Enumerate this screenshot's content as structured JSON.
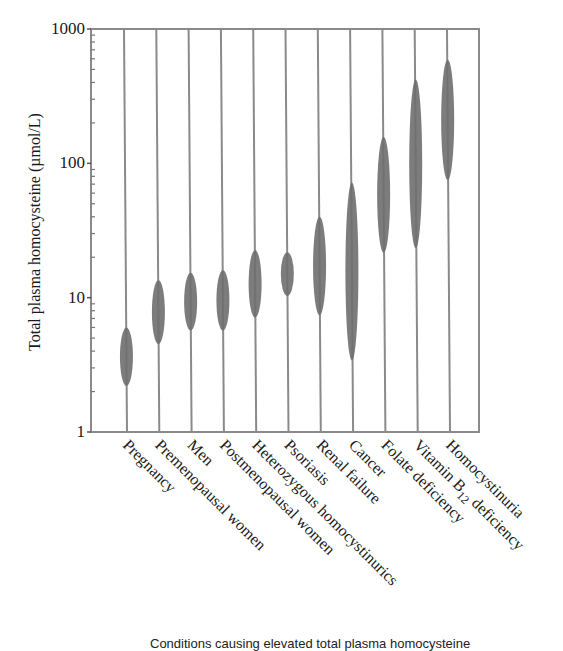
{
  "chart_data": {
    "type": "range",
    "title": "",
    "xlabel": "Conditions causing elevated total plasma homocysteine",
    "ylabel": "Total plasma homocysteine (µmol/L)",
    "yscale": "log",
    "ylim": [
      1,
      1000
    ],
    "yticks": [
      {
        "value": 1,
        "label": "1"
      },
      {
        "value": 10,
        "label": "10"
      },
      {
        "value": 100,
        "label": "100"
      },
      {
        "value": 1000,
        "label": "1000"
      }
    ],
    "grid": false,
    "categories": [
      "Pregnancy",
      "Premenopausal women",
      "Men",
      "Postmenopausal women",
      "Heterozygous homocystinurics",
      "Psoriasis",
      "Renal failure",
      "Cancer",
      "Folate deficiency",
      "Vitamin B12 deficiency",
      "Homocystinuria"
    ],
    "series": [
      {
        "name": "low",
        "values": [
          2.2,
          4.5,
          5.7,
          5.7,
          7.1,
          10.3,
          7.4,
          3.4,
          21.6,
          23.4,
          75
        ]
      },
      {
        "name": "high",
        "values": [
          6.0,
          13.5,
          15.3,
          16.0,
          22.6,
          21.8,
          40,
          72,
          157,
          420,
          590
        ]
      }
    ],
    "bar_color": "#6e6e6e",
    "line_color": "#8a8a8a"
  },
  "caption": {
    "text": "Conditions causing elevated total plasma homocysteine"
  }
}
